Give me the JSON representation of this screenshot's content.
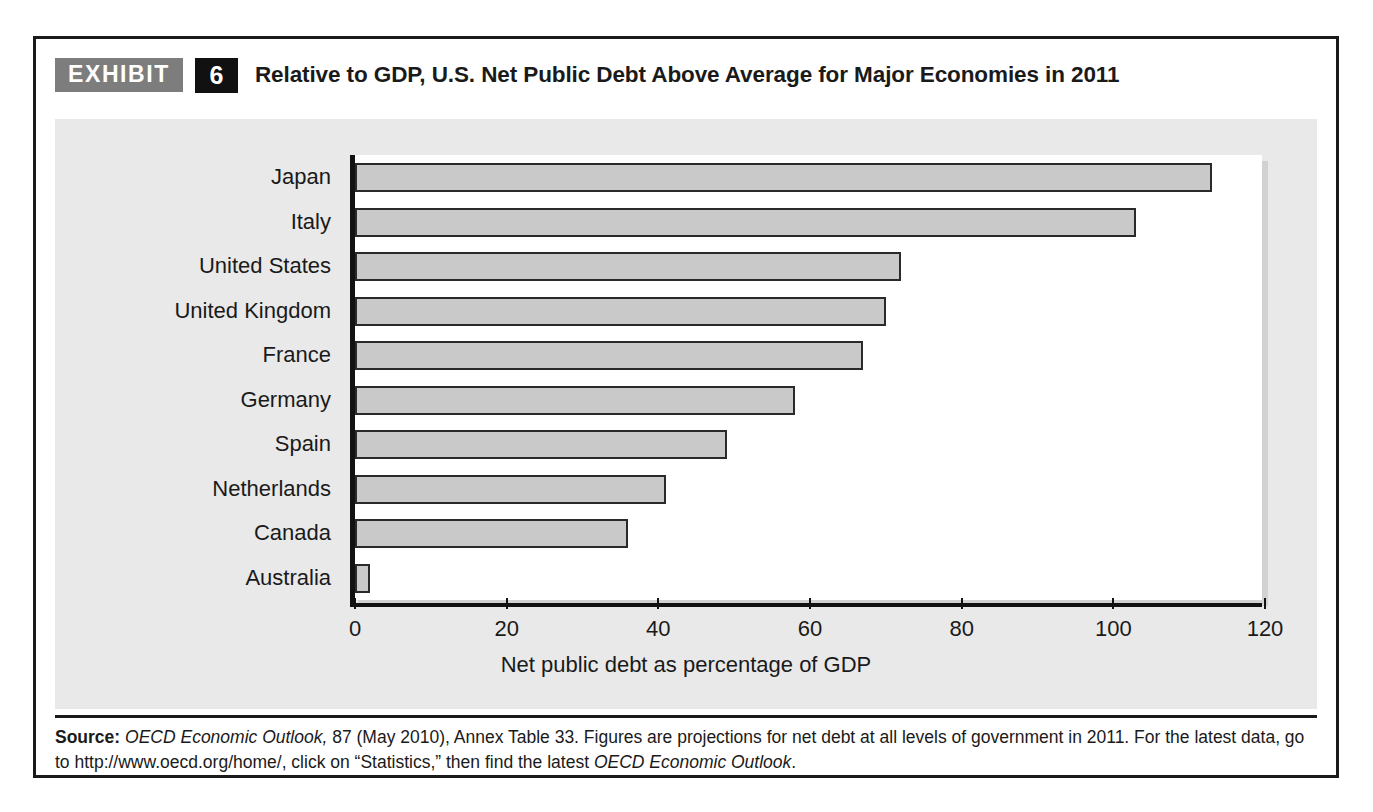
{
  "exhibit": {
    "tag_label": "EXHIBIT",
    "number": "6",
    "title": "Relative to GDP, U.S. Net Public Debt Above Average for Major Economies in 2011"
  },
  "source": {
    "label": "Source:",
    "italic_1": "OECD Economic Outlook,",
    "text_1": " 87 (May 2010), Annex Table 33. Figures are projections for net debt at all levels of government in 2011. For the latest data, go to http://www.oecd.org/home/, click on “Statistics,” then find the latest ",
    "italic_2": "OECD Economic Outlook",
    "text_2": "."
  },
  "colors": {
    "bar_fill": "#c9c9c9",
    "bar_stroke": "#2a2a2a",
    "panel_background": "#e9e9e9",
    "plot_background": "#ffffff",
    "axis": "#121212",
    "tag_background": "#7d7d7d",
    "number_background": "#111111"
  },
  "chart_data": {
    "type": "bar",
    "orientation": "horizontal",
    "title": "Relative to GDP, U.S. Net Public Debt Above Average for Major Economies in 2011",
    "xlabel": "Net public debt as percentage of GDP",
    "ylabel": "",
    "xlim": [
      0,
      120
    ],
    "xticks": [
      0,
      20,
      40,
      60,
      80,
      100,
      120
    ],
    "xticklabels": [
      "0",
      "20",
      "40",
      "60",
      "80",
      "100",
      "120"
    ],
    "grid": false,
    "legend": false,
    "categories": [
      "Japan",
      "Italy",
      "United States",
      "United Kingdom",
      "France",
      "Germany",
      "Spain",
      "Netherlands",
      "Canada",
      "Australia"
    ],
    "values": [
      113,
      103,
      72,
      70,
      67,
      58,
      49,
      41,
      36,
      2
    ]
  }
}
